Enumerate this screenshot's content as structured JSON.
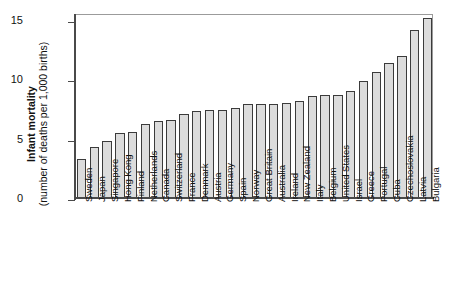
{
  "chart_data": {
    "type": "bar",
    "title": "",
    "subtitle": "",
    "xlabel": "",
    "ylabel_main": "Infant mortality",
    "ylabel_sub": "(number of deaths per 1,000 births)",
    "ylim": [
      0,
      15.6
    ],
    "yticks": [
      0,
      5,
      10,
      15
    ],
    "ytick_labels": [
      "0",
      "5",
      "10",
      "15"
    ],
    "grid": false,
    "legend": false,
    "legend_position": "none",
    "bar_fill_color": "#dcdcdc",
    "bar_edge_color": "#3b3b3b",
    "axis_color": "#4a4a4a",
    "categories": [
      "Sweden",
      "Japan",
      "Singapore",
      "Hong Kong",
      "Finland",
      "Netherlands",
      "Canada",
      "Switzerland",
      "France",
      "Denmark",
      "Austria",
      "Germany",
      "Spain",
      "Norway",
      "Great Britain",
      "Australia",
      "Ireland",
      "New Zealand",
      "Italy",
      "Belgium",
      "United States",
      "Israel",
      "Greece",
      "Portugal",
      "Cuba",
      "Czechoslovakia",
      "Latvia",
      "Bulgaria"
    ],
    "values": [
      3.3,
      4.3,
      4.8,
      5.5,
      5.6,
      6.2,
      6.5,
      6.6,
      7.1,
      7.3,
      7.4,
      7.4,
      7.6,
      7.9,
      7.9,
      7.9,
      8.0,
      8.2,
      8.6,
      8.7,
      8.7,
      9.0,
      9.9,
      10.6,
      11.4,
      12.0,
      14.2,
      15.2
    ]
  }
}
